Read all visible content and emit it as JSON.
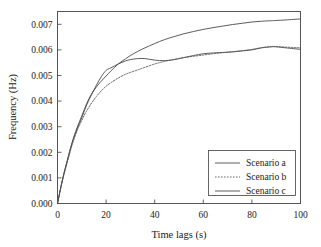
{
  "chart_data": {
    "type": "line",
    "title": "",
    "xlabel": "Time lags (s)",
    "ylabel": "Frequency (Hz)",
    "xlim": [
      0,
      100
    ],
    "ylim": [
      0.0,
      0.0075
    ],
    "grid": false,
    "legend_position": "bottom-right",
    "xticks": [
      0,
      20,
      40,
      60,
      80,
      100
    ],
    "xtick_labels": [
      "0",
      "20",
      "40",
      "60",
      "80",
      "100"
    ],
    "yticks": [
      0.0,
      0.001,
      0.002,
      0.003,
      0.004,
      0.005,
      0.006,
      0.007
    ],
    "ytick_labels": [
      "0.000",
      "0.001",
      "0.002",
      "0.003",
      "0.004",
      "0.005",
      "0.006",
      "0.007"
    ],
    "x": [
      0,
      2,
      4,
      6,
      8,
      10,
      12,
      14,
      16,
      18,
      20,
      22,
      25,
      28,
      30,
      33,
      36,
      40,
      44,
      48,
      52,
      56,
      60,
      64,
      68,
      72,
      76,
      80,
      84,
      88,
      90,
      94,
      100
    ],
    "series": [
      {
        "name": "Scenario a",
        "style": "solid",
        "color": "#4a4a4a",
        "values": [
          0.0,
          0.0009,
          0.00165,
          0.00235,
          0.0029,
          0.00335,
          0.00385,
          0.00425,
          0.00462,
          0.00495,
          0.0052,
          0.0053,
          0.00545,
          0.00557,
          0.00562,
          0.00566,
          0.00566,
          0.0056,
          0.00558,
          0.00562,
          0.0057,
          0.00578,
          0.00585,
          0.00588,
          0.0059,
          0.00592,
          0.00596,
          0.006,
          0.00608,
          0.00612,
          0.00612,
          0.00608,
          0.00602
        ]
      },
      {
        "name": "Scenario b",
        "style": "dotted",
        "color": "#5a5a5a",
        "values": [
          0.0,
          0.00088,
          0.0016,
          0.00228,
          0.00282,
          0.00325,
          0.00362,
          0.00392,
          0.00418,
          0.0044,
          0.00458,
          0.00472,
          0.0049,
          0.00505,
          0.00512,
          0.00522,
          0.00532,
          0.00545,
          0.00555,
          0.00563,
          0.0057,
          0.00575,
          0.0058,
          0.00585,
          0.00589,
          0.00593,
          0.00597,
          0.00602,
          0.00609,
          0.00613,
          0.00613,
          0.00611,
          0.00608
        ]
      },
      {
        "name": "Scenario c",
        "style": "solid",
        "color": "#4a4a4a",
        "values": [
          0.0,
          0.00092,
          0.00168,
          0.00238,
          0.00295,
          0.00342,
          0.0039,
          0.00428,
          0.00455,
          0.00478,
          0.00498,
          0.00518,
          0.00545,
          0.00565,
          0.00578,
          0.00594,
          0.00608,
          0.00625,
          0.0064,
          0.00652,
          0.00663,
          0.00672,
          0.0068,
          0.00687,
          0.00693,
          0.00699,
          0.00704,
          0.00709,
          0.00712,
          0.00714,
          0.00715,
          0.00717,
          0.00721
        ]
      }
    ],
    "legend_entries": [
      {
        "label": "Scenario a",
        "style": "solid"
      },
      {
        "label": "Scenario b",
        "style": "dotted"
      },
      {
        "label": "Scenario c",
        "style": "solid"
      }
    ]
  }
}
